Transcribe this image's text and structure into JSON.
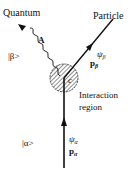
{
  "diagram": {
    "labels": {
      "quantum": "Quantum",
      "particle": "Particle",
      "beta_state": "|β>",
      "alpha_state": "|α>",
      "A": "A",
      "psi_beta": "ψ",
      "psi_beta_sub": "β",
      "p_beta": "p",
      "p_beta_sub": "β",
      "psi_alpha": "ψ",
      "psi_alpha_sub": "α",
      "p_alpha": "p",
      "p_alpha_sub": "α",
      "c": "c",
      "interaction_line1": "Interaction",
      "interaction_line2": "region"
    },
    "colors": {
      "ink": "#111111",
      "background": "#ffffff"
    }
  }
}
